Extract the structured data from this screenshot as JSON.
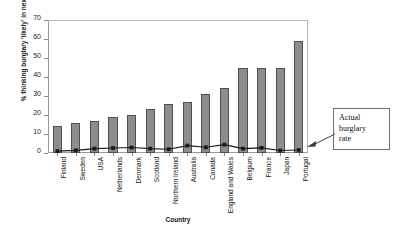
{
  "chart_data": {
    "type": "bar",
    "title": "",
    "xlabel": "Country",
    "ylabel": "% thinking burglary 'likely' in next year",
    "ylim": [
      0,
      70
    ],
    "yticks": [
      0,
      10,
      20,
      30,
      40,
      50,
      60,
      70
    ],
    "grid": false,
    "legend": "none",
    "categories": [
      "Finland",
      "Sweden",
      "USA",
      "Netherlands",
      "Denmark",
      "Scotland",
      "Northern Ireland",
      "Australia",
      "Canada",
      "England and Wales",
      "Belgium",
      "France",
      "Japan",
      "Portugal"
    ],
    "series": [
      {
        "name": "% thinking burglary 'likely' in next year",
        "type": "bar",
        "values": [
          14,
          16,
          17,
          19,
          20,
          23,
          26,
          27,
          31,
          34,
          45,
          45,
          45,
          59
        ]
      },
      {
        "name": "Actual burglary rate",
        "type": "line",
        "values": [
          1.0,
          1.4,
          2.3,
          2.6,
          2.9,
          2.3,
          2.0,
          3.9,
          3.0,
          4.4,
          2.3,
          2.7,
          1.3,
          1.6
        ]
      }
    ],
    "annotations": [
      {
        "id": "actual-burglary-rate",
        "text": "Actual burglary rate",
        "lines": [
          "Actual",
          "burglary",
          "rate"
        ],
        "points_to": "line-series"
      }
    ],
    "colors": {
      "bar_fill": "#8d8d8d",
      "bar_edge": "#4f4f4f",
      "line": "#1a1a1a",
      "marker": "#1a1a1a",
      "axis": "#8c8c8c",
      "background": "#ffffff"
    }
  }
}
